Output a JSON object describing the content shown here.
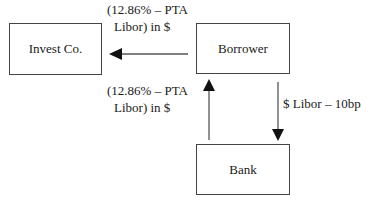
{
  "diagram": {
    "nodes": [
      {
        "id": "invest",
        "label": "Invest Co."
      },
      {
        "id": "borrower",
        "label": "Borrower"
      },
      {
        "id": "bank",
        "label": "Bank"
      }
    ],
    "edges": [
      {
        "from": "borrower",
        "to": "invest",
        "label_line1": "(12.86% – PTA",
        "label_line2": "Libor) in $"
      },
      {
        "from": "bank",
        "to": "borrower",
        "label_line1": "(12.86% – PTA",
        "label_line2": "Libor) in $"
      },
      {
        "from": "borrower",
        "to": "bank",
        "label": "$ Libor – 10bp"
      }
    ]
  }
}
